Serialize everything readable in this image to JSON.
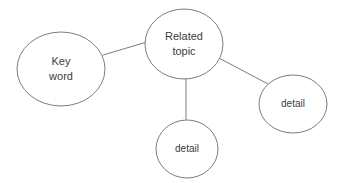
{
  "diagram": {
    "type": "node-link concept map",
    "background_color": "#ffffff",
    "stroke_color": "#7d7d7d",
    "text_color": "#3c3c3c",
    "nodes": [
      {
        "id": "key-word",
        "label_lines": [
          "Key",
          "word"
        ],
        "label": "Key word",
        "shape": "ellipse",
        "cx": 61,
        "cy": 69,
        "rx": 44,
        "ry": 37
      },
      {
        "id": "related-topic",
        "label_lines": [
          "Related",
          "topic"
        ],
        "label": "Related topic",
        "shape": "ellipse",
        "cx": 184,
        "cy": 44,
        "rx": 39,
        "ry": 35
      },
      {
        "id": "detail-bottom",
        "label_lines": [
          "detail"
        ],
        "label": "detail",
        "shape": "ellipse",
        "cx": 187,
        "cy": 149,
        "rx": 31,
        "ry": 29
      },
      {
        "id": "detail-right",
        "label_lines": [
          "detail"
        ],
        "label": "detail",
        "shape": "ellipse",
        "cx": 293,
        "cy": 104,
        "rx": 34,
        "ry": 29
      }
    ],
    "edges": [
      {
        "id": "edge-key-word-to-related-topic",
        "from": "key-word",
        "to": "related-topic",
        "x1": 103,
        "y1": 55,
        "x2": 147,
        "y2": 42
      },
      {
        "id": "edge-related-topic-to-detail-bottom",
        "from": "related-topic",
        "to": "detail-bottom",
        "x1": 186,
        "y1": 78,
        "x2": 186,
        "y2": 121
      },
      {
        "id": "edge-related-topic-to-detail-right",
        "from": "related-topic",
        "to": "detail-right",
        "x1": 217,
        "y1": 57,
        "x2": 268,
        "y2": 84
      }
    ]
  }
}
